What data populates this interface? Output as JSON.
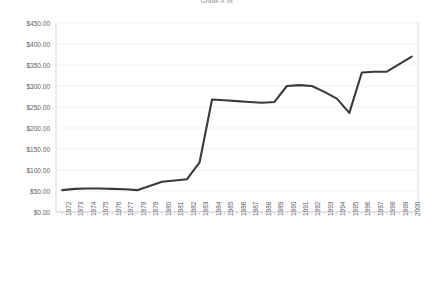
{
  "chart_data": {
    "type": "line",
    "title": "Grade A vs",
    "xlabel": "",
    "ylabel": "",
    "ylim": [
      0,
      450
    ],
    "ytick_values": [
      0,
      50,
      100,
      150,
      200,
      250,
      300,
      350,
      400,
      450
    ],
    "ytick_labels": [
      "$0.00",
      "$50.00",
      "$100.00",
      "$150.00",
      "$200.00",
      "$250.00",
      "$300.00",
      "$350.00",
      "$400.00",
      "$450.00"
    ],
    "grid": true,
    "legend": "none",
    "categories": [
      "1972",
      "1973",
      "1974",
      "1975",
      "1976",
      "1977",
      "1978",
      "1979",
      "1980",
      "1981",
      "1982",
      "1983",
      "1984",
      "1985",
      "1986",
      "1987",
      "1988",
      "1989",
      "1990",
      "1991",
      "1992",
      "1993",
      "1994",
      "1995",
      "1996",
      "1997",
      "1998",
      "1999",
      "2000"
    ],
    "series": [
      {
        "name": "Price",
        "color": "#3a3a3a",
        "values": [
          52,
          55,
          56,
          56,
          55,
          54,
          52,
          62,
          72,
          75,
          78,
          118,
          268,
          266,
          264,
          262,
          260,
          262,
          300,
          302,
          300,
          286,
          270,
          236,
          332,
          334,
          334,
          352,
          370
        ]
      }
    ]
  },
  "layout": {
    "plot_left": 56,
    "plot_right": 418,
    "plot_top": 23,
    "plot_bottom": 212
  }
}
